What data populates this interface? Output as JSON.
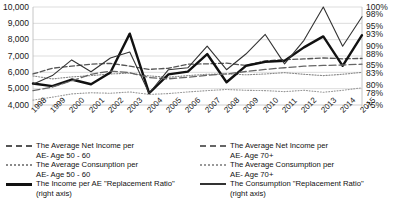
{
  "chart_data": {
    "type": "line",
    "title": "",
    "xlabel": "",
    "ylabel": "",
    "grid": true,
    "legend_position": "bottom",
    "x": [
      1998,
      1999,
      2000,
      2001,
      2002,
      2003,
      2004,
      2005,
      2006,
      2007,
      2008,
      2009,
      2010,
      2011,
      2012,
      2013,
      2014,
      2015
    ],
    "left_axis": {
      "ticks": [
        "10,000",
        "9,000",
        "8,000",
        "7,000",
        "6,000",
        "5,000",
        "4,000"
      ],
      "values": [
        10000,
        9000,
        8000,
        7000,
        6000,
        5000,
        4000
      ],
      "ylim": [
        4000,
        10000
      ]
    },
    "right_axis": {
      "ticks": [
        "100%",
        "98%",
        "95%",
        "93%",
        "90%",
        "88%",
        "85%",
        "83%",
        "80%",
        "78%",
        "75%"
      ],
      "values": [
        100,
        98,
        95,
        93,
        90,
        88,
        85,
        83,
        80,
        78,
        75
      ],
      "ylim": [
        75,
        100
      ]
    },
    "series": [
      {
        "name": "The Average Net Income per AE- Age 50 - 60",
        "axis": "left",
        "style": "dashed",
        "color": "#555555",
        "width": 1.3,
        "values": [
          5900,
          6250,
          6380,
          6500,
          6550,
          6380,
          6180,
          6250,
          6500,
          6520,
          6560,
          6420,
          6700,
          6780,
          6820,
          6880,
          6830,
          6850
        ]
      },
      {
        "name": "The Average Consunption per AE- Age 50 - 60",
        "axis": "left",
        "style": "dotted",
        "color": "#8a8a8a",
        "width": 1.1,
        "values": [
          5780,
          5600,
          5720,
          5800,
          5900,
          5950,
          5780,
          5700,
          5800,
          5880,
          5900,
          5850,
          5900,
          5980,
          5880,
          5800,
          5880,
          6000
        ]
      },
      {
        "name": "The  Income per AE \"Replacement Ratio\" (right axis)",
        "axis": "right",
        "style": "solid-thick",
        "color": "#111111",
        "width": 2.4,
        "values": [
          80.5,
          79.8,
          81.5,
          80.3,
          83.3,
          93.2,
          78.0,
          82.8,
          83.5,
          88.0,
          80.8,
          85.0,
          86.0,
          86.3,
          89.7,
          92.5,
          85.0,
          92.8
        ]
      },
      {
        "name": "The Average Net Income per AE- Age 70+",
        "axis": "left",
        "style": "long-dash",
        "color": "#666666",
        "width": 1.3,
        "values": [
          4880,
          5100,
          5480,
          5880,
          6080,
          5980,
          5680,
          5600,
          5700,
          5820,
          5900,
          6050,
          6180,
          6280,
          6380,
          6420,
          6450,
          6500
        ]
      },
      {
        "name": "The Average Consumption per AE- Age 70+",
        "axis": "left",
        "style": "fine-dot",
        "color": "#999999",
        "width": 1.1,
        "values": [
          4300,
          4480,
          4680,
          4750,
          4720,
          4800,
          4650,
          4700,
          4800,
          4880,
          4950,
          4900,
          4880,
          4820,
          4900,
          4780,
          4900,
          5050
        ]
      },
      {
        "name": "The Consumption \"Replacement Ratio\" (right axis)",
        "axis": "right",
        "style": "solid-thin",
        "color": "#333333",
        "width": 1.1,
        "values": [
          80.3,
          82.5,
          86.5,
          83.5,
          87.0,
          88.5,
          78.0,
          84.0,
          84.5,
          90.0,
          84.0,
          88.0,
          93.0,
          85.5,
          91.5,
          100.0,
          90.0,
          97.5
        ]
      }
    ]
  },
  "legend": {
    "left": [
      {
        "sample": "dashed",
        "line1": "The Average Net Income per",
        "line2": "AE- Age 50 - 60"
      },
      {
        "sample": "dotted",
        "line1": "The Average Consunption per",
        "line2": "AE- Age 50 - 60"
      },
      {
        "sample": "solid-thick",
        "line1": "The  Income per AE \"Replacement Ratio\"",
        "line2": "(right axis)"
      }
    ],
    "right": [
      {
        "sample": "long-dash",
        "line1": "The Average Net Income per",
        "line2": "AE- Age 70+"
      },
      {
        "sample": "fine-dot",
        "line1": "The Average Consumption per",
        "line2": "AE- Age 70+"
      },
      {
        "sample": "solid-thin",
        "line1": "The Consumption \"Replacement Ratio\"",
        "line2": "(right axis)"
      }
    ]
  }
}
